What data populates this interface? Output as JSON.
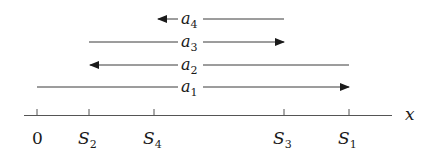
{
  "diagram": {
    "axis": {
      "label": "x",
      "ticks": [
        {
          "id": "origin",
          "label": "0",
          "sub": "",
          "x": 37
        },
        {
          "id": "S2",
          "label": "S",
          "sub": "2",
          "x": 89
        },
        {
          "id": "S4",
          "label": "S",
          "sub": "4",
          "x": 154
        },
        {
          "id": "S3",
          "label": "S",
          "sub": "3",
          "x": 284
        },
        {
          "id": "S1",
          "label": "S",
          "sub": "1",
          "x": 349
        }
      ]
    },
    "arrows": [
      {
        "id": "a4",
        "label": "a",
        "sub": "4",
        "from": "S3",
        "to": "S4",
        "direction": "left",
        "y": 19
      },
      {
        "id": "a3",
        "label": "a",
        "sub": "3",
        "from": "S2",
        "to": "S3",
        "direction": "right",
        "y": 42
      },
      {
        "id": "a2",
        "label": "a",
        "sub": "2",
        "from": "S1",
        "to": "S2",
        "direction": "left",
        "y": 65
      },
      {
        "id": "a1",
        "label": "a",
        "sub": "1",
        "from": "0",
        "to": "S1",
        "direction": "right",
        "y": 87
      }
    ],
    "colors": {
      "line": "#3a3a3a",
      "text": "#1a1a1a",
      "background": "#ffffff"
    }
  }
}
